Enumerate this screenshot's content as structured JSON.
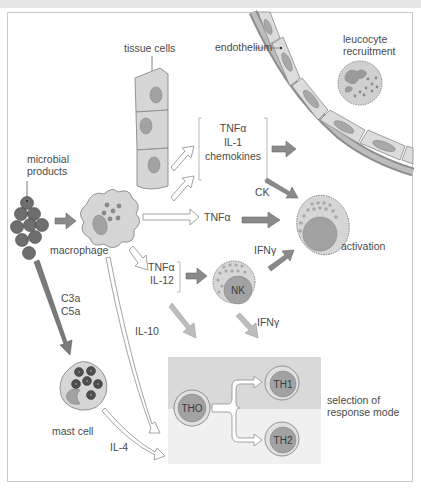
{
  "figure": {
    "labels": {
      "tissue_cells": "tissue cells",
      "endothelium": "endothelium",
      "leucocyte_recruitment_1": "leucocyte",
      "leucocyte_recruitment_2": "recruitment",
      "microbial_products_1": "microbial",
      "microbial_products_2": "products",
      "macrophage": "macrophage",
      "cytokines_group_1": "TNFα",
      "cytokines_group_2": "IL-1",
      "cytokines_group_3": "chemokines",
      "ck": "CK",
      "tnfa_direct": "TNFα",
      "ifng_to_activation": "IFNγ",
      "activation": "activation",
      "tnfa_il12_1": "TNFα",
      "tnfa_il12_2": "IL-12",
      "nk": "NK",
      "ifng_to_selection": "IFNγ",
      "c3a": "C3a",
      "c5a": "C5a",
      "il10": "IL-10",
      "mast_cell": "mast cell",
      "il4": "IL-4",
      "th0": "THO",
      "th1": "TH1",
      "th2": "TH2",
      "selection_1": "selection of",
      "selection_2": "response mode"
    },
    "colors": {
      "cell_fill": "#d6d6d6",
      "nucleus": "#9a9a9a",
      "dark_arrow": "#8a8a8a",
      "light_arrow": "#bdbdbd",
      "microbe": "#6e6e6e",
      "band_top": "#d9d9d9",
      "band_bottom": "#efefef"
    }
  }
}
